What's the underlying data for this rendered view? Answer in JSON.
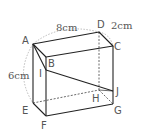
{
  "figure": {
    "type": "rectangular prism (cuboid) with cut plane",
    "colors": {
      "edge": "#222222",
      "hidden": "#444444",
      "arc": "#aaaaaa",
      "text": "#555555"
    },
    "vertices": {
      "A": "A",
      "B": "B",
      "C": "C",
      "D": "D",
      "E": "E",
      "F": "F",
      "G": "G",
      "H": "H",
      "I": "I",
      "J": "J"
    },
    "dimensions": {
      "AD": "8cm",
      "DC": "2cm",
      "AE": "6cm"
    }
  }
}
